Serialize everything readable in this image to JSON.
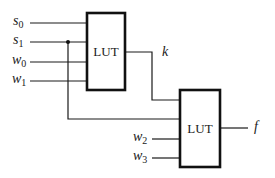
{
  "diagram": {
    "type": "logic-circuit",
    "colors": {
      "stroke": "#111111",
      "background": "#ffffff"
    },
    "lut1": {
      "label": "LUT",
      "inputs": [
        {
          "name": "s",
          "sub": "0"
        },
        {
          "name": "s",
          "sub": "1"
        },
        {
          "name": "w",
          "sub": "0"
        },
        {
          "name": "w",
          "sub": "1"
        }
      ],
      "output": {
        "name": "k"
      }
    },
    "lut2": {
      "label": "LUT",
      "inputs": [
        {
          "name": "k",
          "sub": ""
        },
        {
          "name": "s",
          "sub": "1"
        },
        {
          "name": "w",
          "sub": "2"
        },
        {
          "name": "w",
          "sub": "3"
        }
      ],
      "output": {
        "name": "f"
      }
    },
    "external_inputs": [
      {
        "name": "w",
        "sub": "2"
      },
      {
        "name": "w",
        "sub": "3"
      }
    ]
  }
}
